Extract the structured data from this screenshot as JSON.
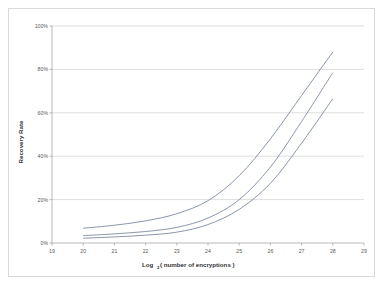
{
  "chart_data": {
    "type": "line",
    "title": "",
    "xlabel": "Log2( number of encryptions )",
    "xlabel_main": "Log",
    "xlabel_sub": "2",
    "xlabel_rest": "( number of encryptions )",
    "ylabel": "Recovery Rate",
    "xlim": [
      19,
      29
    ],
    "ylim": [
      0,
      100
    ],
    "grid": "horizontal",
    "legend": "none",
    "x_ticks": [
      "19",
      "20",
      "21",
      "22",
      "23",
      "24",
      "25",
      "26",
      "27",
      "28",
      "29"
    ],
    "x_tick_values": [
      19,
      20,
      21,
      22,
      23,
      24,
      25,
      26,
      27,
      28,
      29
    ],
    "y_ticks": [
      "0%",
      "20%",
      "40%",
      "60%",
      "80%",
      "100%"
    ],
    "y_tick_values": [
      0,
      20,
      40,
      60,
      80,
      100
    ],
    "x": [
      20,
      21,
      22,
      23,
      24,
      25,
      26,
      27,
      28
    ],
    "series": [
      {
        "name": "upper",
        "color": "#7d8aa0",
        "values": [
          6.8,
          8.2,
          10.2,
          13.5,
          19.5,
          31.0,
          48.0,
          68.0,
          88.0
        ]
      },
      {
        "name": "middle",
        "color": "#7d8aa0",
        "values": [
          3.4,
          4.2,
          5.3,
          7.2,
          11.5,
          20.0,
          35.0,
          56.0,
          78.5
        ]
      },
      {
        "name": "lower",
        "color": "#7d8aa0",
        "values": [
          2.2,
          2.8,
          3.6,
          5.0,
          8.5,
          15.5,
          27.5,
          46.0,
          66.5
        ]
      }
    ]
  },
  "colors": {
    "series": "#7d8aa0",
    "gridline": "#c8c8c8",
    "axis": "#9c9c9c",
    "frame_border": "#d9d9d9",
    "tick_text": "#595959",
    "title_text": "#333333",
    "plot_background": "#ffffff"
  }
}
